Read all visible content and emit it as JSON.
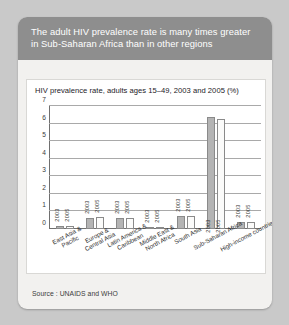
{
  "card": {
    "title": "The adult HIV prevalence rate is many times greater in Sub-Saharan Africa than in other regions",
    "source": "Source : UNAIDS and WHO"
  },
  "chart_data": {
    "type": "bar",
    "title": "HIV prevalence rate, adults ages 15–49, 2003 and 2005 (%)",
    "xlabel": "",
    "ylabel": "",
    "ylim": [
      0,
      7
    ],
    "yticks": [
      0,
      1,
      2,
      3,
      4,
      5,
      6,
      7
    ],
    "ytick_labels": [
      "0",
      "1",
      "2",
      "3",
      "4",
      "5",
      "6",
      "7"
    ],
    "grid": true,
    "legend": "none",
    "categories": [
      "East Asia & Pacific",
      "Europe & Central Asia",
      "Latin America & Caribbean",
      "Middle East & North Africa",
      "South Asia",
      "Sub-Saharan Africa",
      "High-income countries"
    ],
    "series": [
      {
        "name": "2003",
        "color": "#b4b4b4",
        "values": [
          0.15,
          0.6,
          0.6,
          0.08,
          0.75,
          6.4,
          0.4
        ]
      },
      {
        "name": "2005",
        "color": "#fbfbfa",
        "values": [
          0.2,
          0.68,
          0.6,
          0.1,
          0.72,
          6.25,
          0.4
        ]
      }
    ],
    "bar_annotations": [
      [
        "2003",
        "2005"
      ],
      [
        "2003",
        "2005"
      ],
      [
        "2003",
        "2005"
      ],
      [
        "2003",
        "2005"
      ],
      [
        "2003",
        "2005"
      ],
      [
        "2003",
        "2005"
      ],
      [
        "2003",
        "2005"
      ]
    ]
  }
}
